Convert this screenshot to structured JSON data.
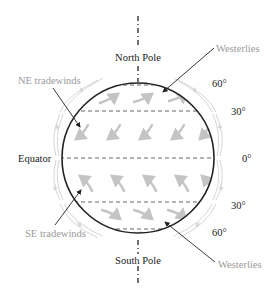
{
  "diagram": {
    "labels": {
      "north_pole": "North Pole",
      "south_pole": "South Pole",
      "equator": "Equator",
      "ne_tradewinds": "NE tradewinds",
      "se_tradewinds": "SE tradewinds",
      "westerlies_north": "Westerlies",
      "westerlies_south": "Westerlies"
    },
    "latitudes": {
      "n60": "60°",
      "n30": "30°",
      "eq": "0°",
      "s30": "30°",
      "s60": "60°"
    },
    "colors": {
      "outline": "#222222",
      "dashes": "#555555",
      "wind_arrows": "#c4c4c4",
      "label_grey": "#9a9a9a",
      "label_dark": "#222222"
    }
  }
}
